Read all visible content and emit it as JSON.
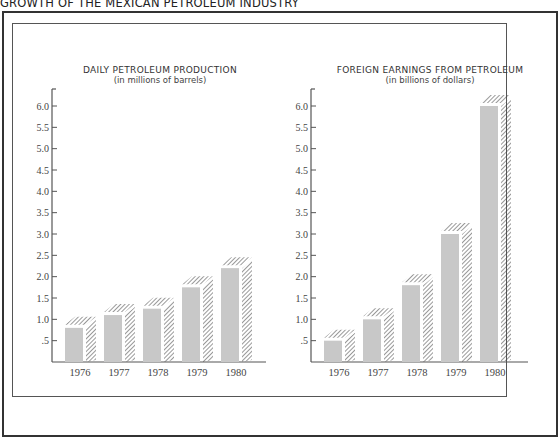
{
  "figure": {
    "title": "GROWTH OF THE MEXICAN PETROLEUM INDUSTRY"
  },
  "colors": {
    "bar_fill": "#c8c8c8",
    "hatch": "#444444",
    "axis": "#555555",
    "frame": "#333333"
  },
  "chart_data": [
    {
      "type": "bar",
      "title": "DAILY PETROLEUM PRODUCTION",
      "subtitle": "(in millions of barrels)",
      "categories": [
        "1976",
        "1977",
        "1978",
        "1979",
        "1980"
      ],
      "values": [
        0.8,
        1.1,
        1.25,
        1.75,
        2.2
      ],
      "xlabel": "",
      "ylabel": "millions of barrels",
      "ylim": [
        0,
        6.5
      ],
      "yticks": [
        ".5",
        "1.0",
        "1.5",
        "2.0",
        "2.5",
        "3.0",
        "3.5",
        "4.0",
        "4.5",
        "5.0",
        "5.5",
        "6.0"
      ],
      "grid": false,
      "legend": null
    },
    {
      "type": "bar",
      "title": "FOREIGN EARNINGS FROM PETROLEUM",
      "subtitle": "(in billions of dollars)",
      "categories": [
        "1976",
        "1977",
        "1978",
        "1979",
        "1980"
      ],
      "values": [
        0.5,
        1.0,
        1.8,
        3.0,
        6.0
      ],
      "xlabel": "",
      "ylabel": "billions of dollars",
      "ylim": [
        0,
        6.5
      ],
      "yticks": [
        ".5",
        "1.0",
        "1.5",
        "2.0",
        "2.5",
        "3.0",
        "3.5",
        "4.0",
        "4.5",
        "5.0",
        "5.5",
        "6.0"
      ],
      "grid": false,
      "legend": null
    }
  ]
}
